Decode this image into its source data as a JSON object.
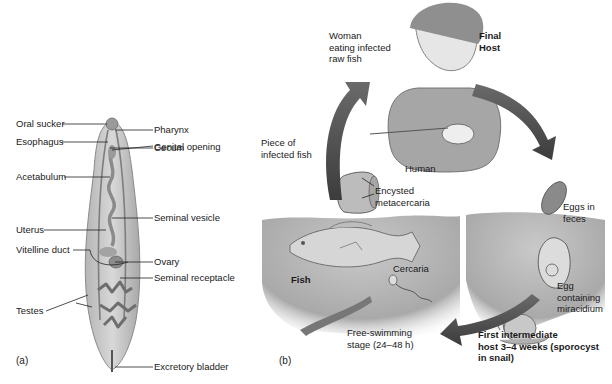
{
  "panel_a": {
    "caption": "(a)",
    "labels": {
      "oral_sucker": "Oral sucker",
      "esophagus": "Esophagus",
      "pharynx": "Pharynx",
      "cecum": "Cecum",
      "acetabulum": "Acetabulum",
      "genital_opening": "Genital opening",
      "uterus": "Uterus",
      "seminal_vesicle": "Seminal vesicle",
      "vitelline_duct": "Vitelline duct",
      "ovary": "Ovary",
      "seminal_receptacle": "Seminal receptacle",
      "testes": "Testes",
      "excretory_bladder": "Excretory bladder"
    }
  },
  "panel_b": {
    "caption": "(b)",
    "labels": {
      "woman": "Woman\neating infected\nraw fish",
      "final_host": "Final\nHost",
      "human": "Human",
      "piece_fish": "Piece of\ninfected fish",
      "encysted": "Encysted\nmetacercaria",
      "eggs_feces": "Eggs in\nfeces",
      "fish": "Fish",
      "cercaria": "Cercaria",
      "egg_miracidium": "Egg\ncontaining\nmiracidium",
      "free_swimming": "Free-swimming\nstage (24–48 h)",
      "first_intermediate": "First intermediate\nhost 3–4 weeks (sporocyst\nin snail)"
    }
  },
  "colors": {
    "arrow": "#555555",
    "water": "#b8b8b8",
    "worm_body": "#c9c9c9",
    "worm_outline": "#8a8a8a",
    "leader_line": "#222222"
  }
}
